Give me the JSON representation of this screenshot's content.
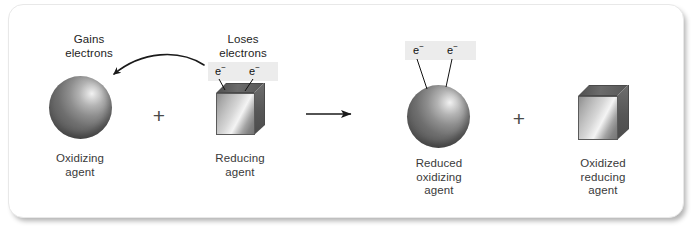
{
  "figure": {
    "type": "redox-reaction-diagram",
    "reactants": [
      {
        "id": "oxidizing-agent",
        "shape": "sphere",
        "top_label": "Gains\nelectrons",
        "bottom_label": "Oxidizing\nagent"
      },
      {
        "id": "reducing-agent",
        "shape": "cube",
        "top_label": "Loses\nelectrons",
        "bottom_label": "Reducing\nagent",
        "electrons": [
          "e⁻",
          "e⁻"
        ]
      }
    ],
    "products": [
      {
        "id": "reduced-oxidizing-agent",
        "shape": "sphere",
        "bottom_label": "Reduced\noxidizing\nagent",
        "electrons": [
          "e⁻",
          "e⁻"
        ]
      },
      {
        "id": "oxidized-reducing-agent",
        "shape": "cube",
        "bottom_label": "Oxidized\nreducing\nagent"
      }
    ],
    "operators": {
      "plus_left": "+",
      "plus_right": "+",
      "reaction_arrow": "⟶"
    },
    "electron_labels": {
      "e1": "e",
      "e1_charge": "−",
      "e2": "e",
      "e2_charge": "−",
      "p1": "e",
      "p1_charge": "−",
      "p2": "e",
      "p2_charge": "−"
    },
    "colors": {
      "card_background": "#ffffff",
      "card_border": "#e8e8e8",
      "heading_text": "#1d1d1d",
      "caption_text": "#3a3a3a",
      "arrow": "#1a1a1a",
      "electron_band": "#ececec",
      "sphere_dark": "#585858",
      "sphere_highlight": "#f2f2f2",
      "cube_face_light": "#f4f4f4",
      "cube_face_dark": "#757575",
      "cube_top": "#565656"
    }
  }
}
